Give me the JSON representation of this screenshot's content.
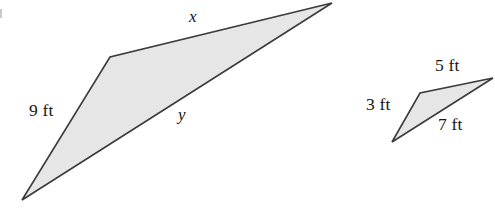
{
  "figure": {
    "colors": {
      "fill": "#e6e6e6",
      "stroke": "#3b3b3b",
      "text": "#161616",
      "background": "#ffffff"
    },
    "large_triangle": {
      "name": "large-triangle",
      "points": "22,200 110,57 332,3",
      "labels": {
        "top": "x",
        "bottom": "y",
        "left": "9 ft"
      }
    },
    "small_triangle": {
      "name": "small-triangle",
      "points": "392,142 420,93 493,78",
      "labels": {
        "top": "5 ft",
        "left": "3 ft",
        "bottom": "7 ft"
      }
    }
  }
}
